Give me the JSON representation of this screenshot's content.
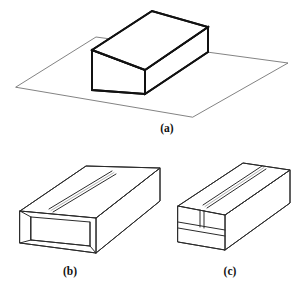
{
  "figure": {
    "background_color": "#ffffff",
    "line_color": "#111111",
    "face_color": "#ffffff",
    "panels": [
      {
        "id": "a",
        "label": "(a)",
        "caption": "(a)",
        "description": "Solid rectangular block resting on a ground plane",
        "label_x": 167,
        "label_y": 132
      },
      {
        "id": "b",
        "label": "(b)",
        "caption": "(b)",
        "description": "Hollow rectangular tube with open end and longitudinal top slot",
        "label_x": 70,
        "label_y": 275
      },
      {
        "id": "c",
        "label": "(c)",
        "caption": "(c)",
        "description": "Rectangular block with top slot and internal horizontal divisions",
        "label_x": 230,
        "label_y": 275
      }
    ],
    "geometry": {
      "panel_a": {
        "ground_plane": "16,87 96,37 288,63 193,117",
        "block_top": "92,50 152,11 208,27 145,70",
        "block_front_left": "92,50 145,70 145,94 92,90",
        "block_front_right": "145,70 208,27 208,52 145,94"
      },
      "panel_b": {
        "top_face": "20,211 86,166 160,168 96,218",
        "left_end_outer": "20,211 96,218 96,253 20,243",
        "right_side": "96,218 160,168 160,201 96,253",
        "slot_top": "49,209 112,171",
        "slot_bottom": "52,212 115,174",
        "inner_back": "31,217 90,221 90,245 31,240",
        "inner_floor": "31,240 90,245"
      },
      "panel_c": {
        "top_face": "178,206 243,163 290,170 225,215",
        "end_face": "178,206 225,215 225,250 178,242",
        "right_side": "225,215 290,170 290,203 225,250",
        "slot_top": "203,205 262,166",
        "slot_bottom": "207,208 265,169",
        "divider_upper": "178,222 225,230",
        "divider_lower": "178,228 225,236",
        "slot_vertical": "200,210 200,228"
      }
    }
  }
}
